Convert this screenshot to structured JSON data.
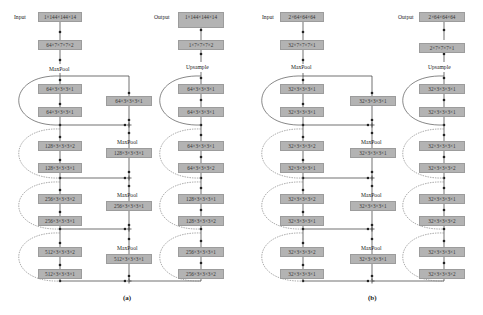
{
  "panels": [
    {
      "caption": "(a)",
      "input_label": "Input",
      "output_label": "Output",
      "encoder": {
        "input_box": "1×144×144×14",
        "stem_box": "64×7×7×7×2",
        "pool_label": "MaxPool",
        "blocks": [
          [
            "64×3×3×3×1",
            "64×3×3×3×1"
          ],
          [
            "128×3×3×3×2",
            "128×3×3×3×1"
          ],
          [
            "256×3×3×3×2",
            "256×3×3×3×1"
          ],
          [
            "512×3×3×3×2",
            "512×3×3×3×1"
          ]
        ]
      },
      "shortcut": {
        "boxes": [
          "64×3×3×3×1",
          "128×3×3×3×1",
          "256×3×3×3×1",
          "512×3×3×3×1"
        ],
        "pool_label": "MaxPool"
      },
      "decoder": {
        "output_box": "1×144×144×14",
        "head_box": "1×7×7×7×2",
        "upsample_label": "Upsample",
        "blocks": [
          [
            "64×3×3×3×1",
            "64×3×3×3×1"
          ],
          [
            "64×3×3×3×1",
            "64×3×3×3×2"
          ],
          [
            "128×3×3×3×1",
            "128×3×3×3×2"
          ],
          [
            "256×3×3×3×1",
            "256×3×3×3×2"
          ]
        ]
      }
    },
    {
      "caption": "(b)",
      "input_label": "Input",
      "output_label": "Output",
      "encoder": {
        "input_box": "2×64×64×64",
        "stem_box": "32×7×7×7×1",
        "pool_label": "MaxPool",
        "blocks": [
          [
            "32×3×3×3×1",
            "32×3×3×3×1"
          ],
          [
            "32×3×3×3×2",
            "32×3×3×3×1"
          ],
          [
            "32×3×3×3×2",
            "32×3×3×3×1"
          ],
          [
            "32×3×3×3×2",
            "32×3×3×3×1"
          ]
        ]
      },
      "shortcut": {
        "boxes": [
          "32×3×3×3×1",
          "32×3×3×3×1",
          "32×3×3×3×1",
          "32×3×3×3×1"
        ],
        "pool_label": "MaxPool"
      },
      "decoder": {
        "output_box": "2×64×64×64",
        "head_box": "2×7×7×7×1",
        "upsample_label": "Upsample",
        "blocks": [
          [
            "32×3×3×3×1",
            "32×3×3×3×1"
          ],
          [
            "32×3×3×3×1",
            "32×3×3×3×2"
          ],
          [
            "32×3×3×3×1",
            "32×3×3×3×2"
          ],
          [
            "32×3×3×3×1",
            "32×3×3×3×2"
          ]
        ]
      }
    }
  ],
  "colors": {
    "box_fill": "#b3b3b3",
    "line": "#333333",
    "skip_solid": "#555555",
    "skip_dashed": "#888888"
  }
}
